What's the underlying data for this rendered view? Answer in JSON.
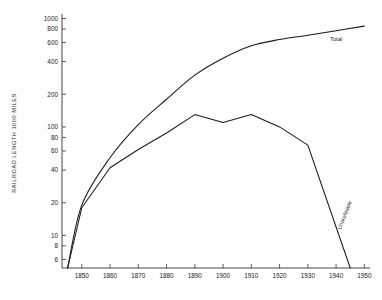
{
  "chart_data": {
    "type": "line",
    "title": "",
    "xlabel": "",
    "ylabel": "RAILROAD LENGTH  1000 MILES",
    "yscale": "log",
    "xscale": "linear",
    "xlim": [
      1843,
      1952
    ],
    "ylim": [
      5,
      1100
    ],
    "grid": false,
    "legend_position": "inline-annotation",
    "x_ticks": [
      1850,
      1860,
      1870,
      1880,
      1890,
      1900,
      1910,
      1920,
      1930,
      1940,
      1950
    ],
    "x_tick_labels": [
      "1850",
      "1860",
      "1870",
      "1880",
      "1890",
      "1900",
      "1910",
      "1920",
      "1930",
      "1940",
      "1950"
    ],
    "y_ticks": [
      6,
      8,
      10,
      20,
      40,
      60,
      80,
      100,
      200,
      400,
      600,
      800,
      1000
    ],
    "y_tick_labels": [
      "6",
      "8",
      "10",
      "20",
      "40",
      "60",
      "80",
      "100",
      "200",
      "400",
      "600",
      "800",
      "1000"
    ],
    "series": [
      {
        "name": "Total",
        "label": "Total",
        "x": [
          1845,
          1850,
          1860,
          1870,
          1880,
          1890,
          1900,
          1910,
          1920,
          1930,
          1940,
          1950
        ],
        "values": [
          5,
          19,
          52,
          105,
          180,
          300,
          430,
          560,
          640,
          700,
          770,
          850
        ]
      },
      {
        "name": "Unprofitable",
        "label": "Unprofitable",
        "x": [
          1845,
          1850,
          1860,
          1870,
          1880,
          1890,
          1900,
          1910,
          1920,
          1930,
          1945
        ],
        "values": [
          5,
          18,
          42,
          62,
          88,
          130,
          110,
          130,
          100,
          68,
          5
        ]
      }
    ]
  },
  "axis": {
    "y_title": "RAILROAD LENGTH  1000 MILES"
  },
  "labels": {
    "total": "Total",
    "unprofitable": "Unprofitable"
  },
  "colors": {
    "line": "#1a1a1a",
    "axis": "#333333",
    "background": "#fefefe"
  }
}
